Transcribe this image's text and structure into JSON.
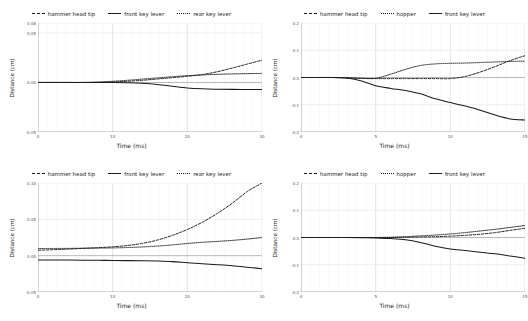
{
  "figure": {
    "panels": [
      {
        "id": "top-left",
        "legend": [
          {
            "label": "hammer head tip",
            "style": "dashed"
          },
          {
            "label": "front key lever",
            "style": "solid"
          },
          {
            "label": "rear key lever",
            "style": "dotted"
          }
        ],
        "chart_data": {
          "type": "line",
          "title": "",
          "xlabel": "Time (ms)",
          "ylabel": "Distance (cm)",
          "xlim": [
            0,
            30
          ],
          "ylim": [
            -0.05,
            0.06
          ],
          "xticks": [
            0,
            10,
            20,
            30
          ],
          "xticklabels": [
            "0",
            "10",
            "20",
            "30"
          ],
          "yticks": [
            -0.05,
            0.0,
            0.05,
            0.06
          ],
          "yticklabels": [
            "-0.05",
            "0.00",
            "0.05",
            "0.06"
          ],
          "grid": true,
          "legend_position": "above",
          "x": [
            0,
            2,
            4,
            6,
            8,
            10,
            12,
            14,
            16,
            18,
            20,
            22,
            24,
            26,
            28,
            30
          ],
          "series": [
            {
              "name": "hammer head tip",
              "style": "dashed",
              "values": [
                0.0,
                0.0,
                0.0,
                0.0,
                0.0,
                0.0005,
                0.0012,
                0.0022,
                0.0035,
                0.0048,
                0.0062,
                0.008,
                0.0108,
                0.0145,
                0.0185,
                0.0225
              ]
            },
            {
              "name": "front key lever",
              "style": "solid",
              "values": [
                0.0,
                0.0,
                0.0,
                0.0,
                0.0,
                0.0,
                -0.0002,
                -0.0008,
                -0.002,
                -0.0038,
                -0.0055,
                -0.0064,
                -0.0068,
                -0.007,
                -0.0071,
                -0.0072
              ]
            },
            {
              "name": "rear key lever",
              "style": "dotted",
              "values": [
                0.0,
                0.0,
                0.0,
                0.0,
                0.0005,
                0.0012,
                0.0022,
                0.0034,
                0.0046,
                0.0058,
                0.0068,
                0.0076,
                0.0082,
                0.0086,
                0.0089,
                0.0091
              ]
            }
          ]
        }
      },
      {
        "id": "top-right",
        "legend": [
          {
            "label": "hammer head tip",
            "style": "dashed"
          },
          {
            "label": "hopper",
            "style": "dotted"
          },
          {
            "label": "front key lever",
            "style": "solid"
          }
        ],
        "chart_data": {
          "type": "line",
          "title": "",
          "xlabel": "Time (ms)",
          "ylabel": "Distance (cm)",
          "xlim": [
            0,
            15
          ],
          "ylim": [
            -0.2,
            0.2
          ],
          "xticks": [
            0,
            5,
            10,
            15
          ],
          "xticklabels": [
            "0",
            "5",
            "10",
            "15"
          ],
          "yticks": [
            -0.2,
            -0.1,
            0.0,
            0.1,
            0.2
          ],
          "yticklabels": [
            "-0.2",
            "-0.1",
            "0.0",
            "0.1",
            "0.2"
          ],
          "grid": true,
          "legend_position": "above",
          "x": [
            0,
            1,
            2,
            3,
            4,
            5,
            6,
            7,
            8,
            9,
            10,
            11,
            12,
            13,
            14,
            15
          ],
          "series": [
            {
              "name": "hammer head tip",
              "style": "dashed",
              "values": [
                0.0,
                0.0,
                0.0,
                -0.001,
                -0.003,
                -0.004,
                -0.004,
                -0.004,
                -0.004,
                -0.004,
                -0.004,
                0.004,
                0.02,
                0.04,
                0.062,
                0.08
              ]
            },
            {
              "name": "hopper",
              "style": "dotted",
              "values": [
                0.0,
                0.0,
                0.0,
                -0.001,
                -0.003,
                -0.003,
                0.012,
                0.03,
                0.044,
                0.05,
                0.052,
                0.053,
                0.055,
                0.057,
                0.059,
                0.06
              ]
            },
            {
              "name": "front key lever",
              "style": "solid",
              "values": [
                0.0,
                0.0,
                0.0,
                -0.002,
                -0.012,
                -0.03,
                -0.04,
                -0.048,
                -0.06,
                -0.078,
                -0.092,
                -0.105,
                -0.12,
                -0.138,
                -0.152,
                -0.156
              ]
            }
          ]
        }
      },
      {
        "id": "bottom-left",
        "legend": [
          {
            "label": "hammer head tip",
            "style": "dashed"
          },
          {
            "label": "front key lever",
            "style": "solid"
          },
          {
            "label": "rear key lever",
            "style": "dotted"
          }
        ],
        "chart_data": {
          "type": "line",
          "title": "",
          "xlabel": "Time (ms)",
          "ylabel": "Distance (cm)",
          "xlim": [
            0,
            30
          ],
          "ylim": [
            -0.05,
            0.1
          ],
          "xticks": [
            0,
            10,
            20,
            30
          ],
          "xticklabels": [
            "0",
            "10",
            "20",
            "30"
          ],
          "yticks": [
            -0.05,
            0.0,
            0.05,
            0.1
          ],
          "yticklabels": [
            "-0.05",
            "0.00",
            "0.05",
            "0.10"
          ],
          "grid": true,
          "legend_position": "above",
          "x": [
            0,
            2,
            4,
            6,
            8,
            10,
            12,
            14,
            16,
            18,
            20,
            22,
            24,
            26,
            28,
            30
          ],
          "series": [
            {
              "name": "hammer head tip",
              "style": "dashed",
              "values": [
                0.0075,
                0.0082,
                0.009,
                0.01,
                0.011,
                0.0122,
                0.014,
                0.017,
                0.0215,
                0.028,
                0.036,
                0.046,
                0.058,
                0.072,
                0.088,
                0.1
              ]
            },
            {
              "name": "front key lever",
              "style": "solid",
              "values": [
                -0.006,
                -0.006,
                -0.0061,
                -0.0062,
                -0.0064,
                -0.0066,
                -0.0068,
                -0.007,
                -0.0074,
                -0.0082,
                -0.0098,
                -0.0112,
                -0.0124,
                -0.0138,
                -0.0158,
                -0.018
              ]
            },
            {
              "name": "rear key lever",
              "style": "dotted",
              "values": [
                0.0098,
                0.0099,
                0.01,
                0.0102,
                0.0104,
                0.0107,
                0.0112,
                0.012,
                0.0132,
                0.0148,
                0.0168,
                0.0184,
                0.0196,
                0.021,
                0.0228,
                0.025
              ]
            }
          ]
        }
      },
      {
        "id": "bottom-right",
        "legend": [
          {
            "label": "hammer head tip",
            "style": "dashed"
          },
          {
            "label": "hopper",
            "style": "dotted"
          },
          {
            "label": "front key lever",
            "style": "solid"
          }
        ],
        "chart_data": {
          "type": "line",
          "title": "",
          "xlabel": "Time (ms)",
          "ylabel": "Distance (cm)",
          "xlim": [
            0,
            15
          ],
          "ylim": [
            -0.2,
            0.2
          ],
          "xticks": [
            0,
            5,
            10,
            15
          ],
          "xticklabels": [
            "0",
            "5",
            "10",
            "15"
          ],
          "yticks": [
            -0.2,
            -0.1,
            0.0,
            0.1,
            0.2
          ],
          "yticklabels": [
            "-0.2",
            "-0.1",
            "0.0",
            "0.1",
            "0.2"
          ],
          "grid": true,
          "legend_position": "above",
          "x": [
            0,
            1,
            2,
            3,
            4,
            5,
            6,
            7,
            8,
            9,
            10,
            11,
            12,
            13,
            14,
            15
          ],
          "series": [
            {
              "name": "hammer head tip",
              "style": "dashed",
              "values": [
                0.0,
                0.0,
                0.0,
                0.0,
                0.0,
                0.0,
                0.0,
                0.001,
                0.002,
                0.003,
                0.005,
                0.008,
                0.012,
                0.018,
                0.026,
                0.034
              ]
            },
            {
              "name": "hopper",
              "style": "dotted",
              "values": [
                0.0,
                0.0,
                0.0,
                0.0,
                0.0,
                0.0,
                0.001,
                0.003,
                0.006,
                0.009,
                0.013,
                0.018,
                0.024,
                0.03,
                0.037,
                0.044
              ]
            },
            {
              "name": "front key lever",
              "style": "solid",
              "values": [
                0.0,
                0.0,
                0.0,
                0.0,
                -0.001,
                -0.002,
                -0.004,
                -0.008,
                -0.018,
                -0.032,
                -0.042,
                -0.048,
                -0.054,
                -0.06,
                -0.068,
                -0.076
              ]
            }
          ]
        }
      }
    ]
  }
}
